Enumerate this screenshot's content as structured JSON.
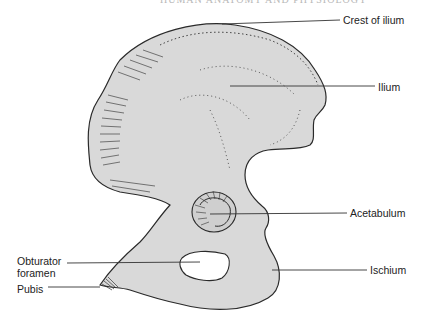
{
  "figure": {
    "running_header": "HUMAN ANATOMY AND PHYSIOLOGY",
    "colors": {
      "bone_fill": "#d9d9d9",
      "outline": "#2a2a2a",
      "leader_line": "#333333",
      "label_text": "#222222",
      "background": "#ffffff"
    },
    "labels": [
      {
        "id": "crest-of-ilium",
        "text": "Crest of ilium"
      },
      {
        "id": "ilium",
        "text": "Ilium"
      },
      {
        "id": "acetabulum",
        "text": "Acetabulum"
      },
      {
        "id": "ischium",
        "text": "Ischium"
      },
      {
        "id": "obturator-foramen",
        "text": "Obturator foramen"
      },
      {
        "id": "pubis",
        "text": "Pubis"
      }
    ]
  }
}
